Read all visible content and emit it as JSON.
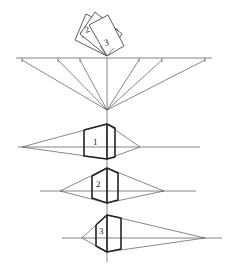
{
  "diagram": {
    "cards": {
      "labels": [
        "1",
        "2",
        "3"
      ]
    },
    "top_horizon": {
      "y": 58,
      "x_start": 16,
      "x_end": 212,
      "tick_xs": [
        22,
        58,
        80,
        139,
        162,
        205
      ],
      "convergence_point": [
        107,
        110
      ]
    },
    "vertical_axis_x": 107,
    "boxes": [
      {
        "label": "1",
        "horizon_y": 147,
        "left_vp_x": 22,
        "right_vp_x": 140,
        "top_y": 124,
        "bottom_y": 159,
        "left_x": 84,
        "right_x": 115
      },
      {
        "label": "2",
        "horizon_y": 191,
        "left_vp_x": 60,
        "right_vp_x": 164,
        "top_y": 168,
        "bottom_y": 203,
        "left_x": 92,
        "right_x": 118
      },
      {
        "label": "3",
        "horizon_y": 238,
        "left_vp_x": 82,
        "right_vp_x": 205,
        "top_y": 215,
        "bottom_y": 252,
        "left_x": 96,
        "right_x": 121
      }
    ],
    "colors": {
      "line": "#555555",
      "bold": "#222222",
      "background": "#ffffff"
    }
  }
}
